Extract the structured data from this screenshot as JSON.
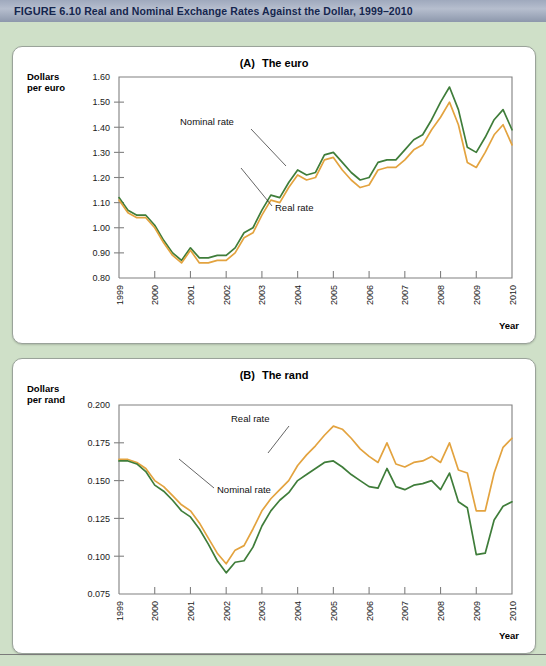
{
  "figure": {
    "number": "FIGURE 6.10",
    "title": "Real and Nominal Exchange Rates Against the Dollar, 1999–2010"
  },
  "theme": {
    "background": "#cfe0c8",
    "panel_background": "#ffffff",
    "banner_color": "#a6b0c3",
    "banner_text_color": "#15264e",
    "nominal_color": "#3f7d3a",
    "real_color": "#e3a33f",
    "axis_color": "#808080"
  },
  "chart_data": [
    {
      "id": "euro",
      "type": "line",
      "panel_tag": "(A)",
      "title": "The euro",
      "ylabel": "Dollars\nper euro",
      "ylabel_line1": "Dollars",
      "ylabel_line2": "per euro",
      "xlabel": "Year",
      "ylim": [
        0.8,
        1.6
      ],
      "ytick_labels": [
        "1.60",
        "1.50",
        "1.40",
        "1.30",
        "1.20",
        "1.10",
        "1.00",
        "0.90",
        "0.80"
      ],
      "ytick_values": [
        1.6,
        1.5,
        1.4,
        1.3,
        1.2,
        1.1,
        1.0,
        0.9,
        0.8
      ],
      "xlim": [
        1999,
        2010
      ],
      "xtick_labels": [
        "1999",
        "2000",
        "2001",
        "2002",
        "2003",
        "2004",
        "2005",
        "2006",
        "2007",
        "2008",
        "2009",
        "2010"
      ],
      "xtick_values": [
        1999,
        2000,
        2001,
        2002,
        2003,
        2004,
        2005,
        2006,
        2007,
        2008,
        2009,
        2010
      ],
      "grid": false,
      "legend": "annotated",
      "annotations": [
        {
          "label": "Nominal rate",
          "points_to_series": "Nominal rate"
        },
        {
          "label": "Real rate",
          "points_to_series": "Real rate"
        }
      ],
      "x": [
        1999.0,
        1999.25,
        1999.5,
        1999.75,
        2000.0,
        2000.25,
        2000.5,
        2000.75,
        2001.0,
        2001.25,
        2001.5,
        2001.75,
        2002.0,
        2002.25,
        2002.5,
        2002.75,
        2003.0,
        2003.25,
        2003.5,
        2003.75,
        2004.0,
        2004.25,
        2004.5,
        2004.75,
        2005.0,
        2005.25,
        2005.5,
        2005.75,
        2006.0,
        2006.25,
        2006.5,
        2006.75,
        2007.0,
        2007.25,
        2007.5,
        2007.75,
        2008.0,
        2008.25,
        2008.5,
        2008.75,
        2009.0,
        2009.25,
        2009.5,
        2009.75,
        2010.0
      ],
      "series": [
        {
          "name": "Nominal rate",
          "color": "#3f7d3a",
          "values": [
            1.12,
            1.07,
            1.05,
            1.05,
            1.01,
            0.95,
            0.9,
            0.87,
            0.92,
            0.88,
            0.88,
            0.89,
            0.89,
            0.92,
            0.98,
            1.0,
            1.07,
            1.13,
            1.12,
            1.18,
            1.23,
            1.21,
            1.22,
            1.29,
            1.3,
            1.26,
            1.22,
            1.19,
            1.2,
            1.26,
            1.27,
            1.27,
            1.31,
            1.35,
            1.37,
            1.43,
            1.5,
            1.56,
            1.47,
            1.32,
            1.3,
            1.36,
            1.43,
            1.47,
            1.39
          ],
          "last_value": 1.39,
          "min": 0.87,
          "max": 1.57
        },
        {
          "name": "Real rate",
          "color": "#e3a33f",
          "values": [
            1.11,
            1.06,
            1.04,
            1.04,
            1.0,
            0.94,
            0.89,
            0.86,
            0.91,
            0.86,
            0.86,
            0.87,
            0.87,
            0.9,
            0.96,
            0.98,
            1.05,
            1.11,
            1.1,
            1.16,
            1.21,
            1.19,
            1.2,
            1.27,
            1.28,
            1.23,
            1.19,
            1.16,
            1.17,
            1.23,
            1.24,
            1.24,
            1.27,
            1.31,
            1.33,
            1.39,
            1.44,
            1.5,
            1.41,
            1.26,
            1.24,
            1.3,
            1.37,
            1.41,
            1.33
          ],
          "last_value": 1.33,
          "min": 0.86,
          "max": 1.5
        }
      ]
    },
    {
      "id": "rand",
      "type": "line",
      "panel_tag": "(B)",
      "title": "The rand",
      "ylabel_line1": "Dollars",
      "ylabel_line2": "per rand",
      "xlabel": "Year",
      "ylim": [
        0.075,
        0.2
      ],
      "ytick_labels": [
        "0.200",
        "0.175",
        "0.150",
        "0.125",
        "0.100",
        "0.075"
      ],
      "ytick_values": [
        0.2,
        0.175,
        0.15,
        0.125,
        0.1,
        0.075
      ],
      "xlim": [
        1999,
        2010
      ],
      "xtick_labels": [
        "1999",
        "2000",
        "2001",
        "2002",
        "2003",
        "2004",
        "2005",
        "2006",
        "2007",
        "2008",
        "2009",
        "2010"
      ],
      "xtick_values": [
        1999,
        2000,
        2001,
        2002,
        2003,
        2004,
        2005,
        2006,
        2007,
        2008,
        2009,
        2010
      ],
      "grid": false,
      "legend": "annotated",
      "annotations": [
        {
          "label": "Real rate",
          "points_to_series": "Real rate"
        },
        {
          "label": "Nominal rate",
          "points_to_series": "Nominal rate"
        }
      ],
      "x": [
        1999.0,
        1999.25,
        1999.5,
        1999.75,
        2000.0,
        2000.25,
        2000.5,
        2000.75,
        2001.0,
        2001.25,
        2001.5,
        2001.75,
        2002.0,
        2002.25,
        2002.5,
        2002.75,
        2003.0,
        2003.25,
        2003.5,
        2003.75,
        2004.0,
        2004.25,
        2004.5,
        2004.75,
        2005.0,
        2005.25,
        2005.5,
        2005.75,
        2006.0,
        2006.25,
        2006.5,
        2006.75,
        2007.0,
        2007.25,
        2007.5,
        2007.75,
        2008.0,
        2008.25,
        2008.5,
        2008.75,
        2009.0,
        2009.25,
        2009.5,
        2009.75,
        2010.0
      ],
      "series": [
        {
          "name": "Real rate",
          "color": "#e3a33f",
          "values": [
            0.164,
            0.164,
            0.162,
            0.158,
            0.15,
            0.146,
            0.14,
            0.134,
            0.13,
            0.122,
            0.112,
            0.102,
            0.095,
            0.104,
            0.107,
            0.118,
            0.13,
            0.138,
            0.144,
            0.15,
            0.16,
            0.167,
            0.173,
            0.18,
            0.186,
            0.184,
            0.178,
            0.171,
            0.166,
            0.162,
            0.175,
            0.161,
            0.159,
            0.162,
            0.163,
            0.166,
            0.162,
            0.175,
            0.157,
            0.155,
            0.13,
            0.13,
            0.155,
            0.172,
            0.178
          ],
          "last_value": 0.178,
          "min": 0.095,
          "max": 0.188
        },
        {
          "name": "Nominal rate",
          "color": "#3f7d3a",
          "values": [
            0.163,
            0.163,
            0.161,
            0.156,
            0.147,
            0.143,
            0.137,
            0.13,
            0.126,
            0.118,
            0.108,
            0.097,
            0.089,
            0.096,
            0.097,
            0.106,
            0.12,
            0.13,
            0.137,
            0.142,
            0.15,
            0.154,
            0.158,
            0.162,
            0.163,
            0.159,
            0.154,
            0.15,
            0.146,
            0.145,
            0.158,
            0.146,
            0.144,
            0.147,
            0.148,
            0.15,
            0.144,
            0.155,
            0.136,
            0.132,
            0.101,
            0.102,
            0.124,
            0.133,
            0.136
          ],
          "last_value": 0.136,
          "min": 0.089,
          "max": 0.164
        }
      ]
    }
  ]
}
